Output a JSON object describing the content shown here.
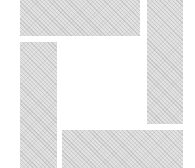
{
  "logo": {
    "description": "pinwheel frame of four dithered gray bars",
    "fill_color": "#e2e2e2",
    "background_color": "#ffffff"
  }
}
